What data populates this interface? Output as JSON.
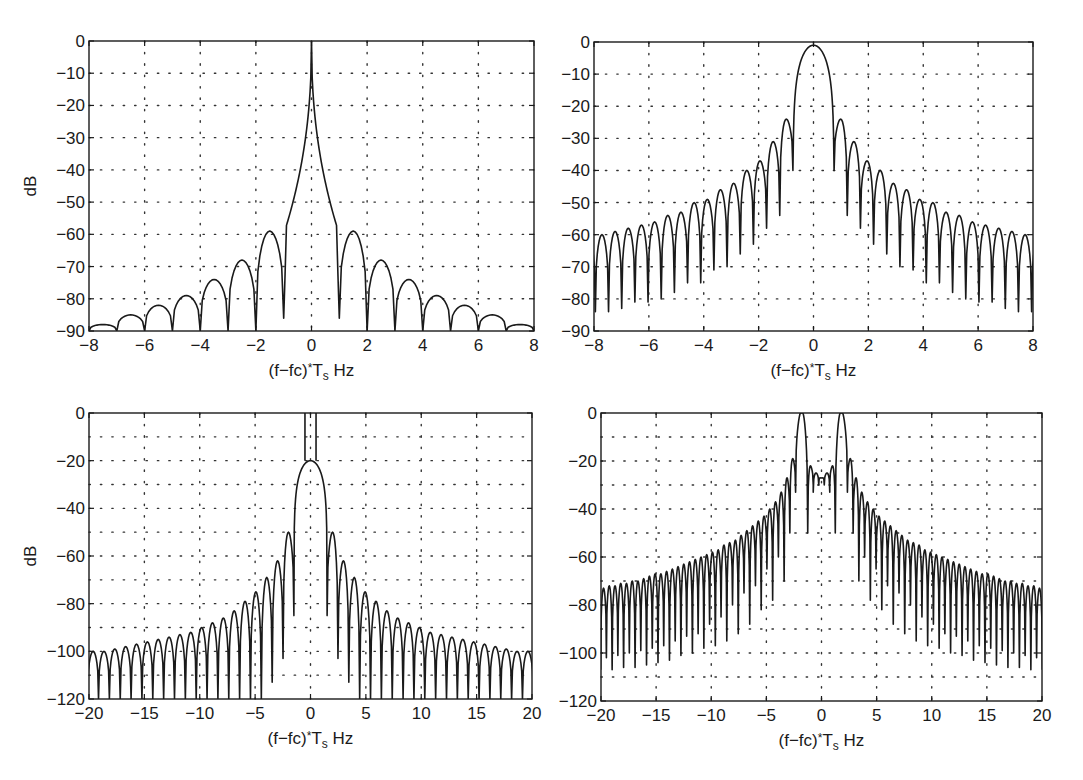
{
  "figure": {
    "xlabel_parts": {
      "pre": "(f−fc)",
      "sup": "*",
      "mid": "T",
      "sub": "s",
      "post": " Hz"
    },
    "ylabel": "dB",
    "line_color": "#1a1a1a",
    "grid_color": "#333333"
  },
  "chart_data": [
    {
      "id": "top-left",
      "type": "line",
      "title": "",
      "xlabel": "(f-fc)*Ts Hz",
      "ylabel": "dB",
      "xlim": [
        -8,
        8
      ],
      "ylim": [
        -90,
        0
      ],
      "xticks": [
        -8,
        -6,
        -4,
        -2,
        0,
        2,
        4,
        6,
        8
      ],
      "yticks": [
        0,
        -10,
        -20,
        -30,
        -40,
        -50,
        -60,
        -70,
        -80,
        -90
      ],
      "ytick_labels": [
        "0",
        "−10",
        "−20",
        "−30",
        "−40",
        "−50",
        "−60",
        "−70",
        "−80",
        "−90"
      ],
      "xtick_labels": [
        "−8",
        "−6",
        "−4",
        "−2",
        "0",
        "2",
        "4",
        "6",
        "8"
      ],
      "grid": true,
      "grid_y_step": 10,
      "grid_x_step": 2,
      "box": {
        "left": 89,
        "top": 41,
        "right": 534,
        "bottom": 331
      },
      "main_lobe": {
        "peak": 0,
        "null_at": 1.0,
        "null_depth": -86,
        "shape": "sharp"
      },
      "lobe_spacing": 1.0,
      "first_lobe_start": 1.0,
      "sidelobe_peaks": [
        -59,
        -68,
        -74,
        -79,
        -82,
        -85,
        -88
      ],
      "null_depths": [
        -86,
        -90,
        -90,
        -90,
        -90,
        -90,
        -90,
        -90
      ],
      "series": [
        {
          "name": "spectrum",
          "description": "Sharp spike to 0 dB at 0, sidelobes peaking at -59 (±1.4), -68 (±2.5), -74 (±3.5), -79 (±4.5), -82 (±5.5), -85 (±6.5), -88 (±7.5), nulls at integer offsets"
        }
      ]
    },
    {
      "id": "top-right",
      "type": "line",
      "title": "",
      "xlabel": "(f-fc)*Ts Hz",
      "ylabel": "",
      "xlim": [
        -8,
        8
      ],
      "ylim": [
        -90,
        0
      ],
      "xticks": [
        -8,
        -6,
        -4,
        -2,
        0,
        2,
        4,
        6,
        8
      ],
      "yticks": [
        0,
        -10,
        -20,
        -30,
        -40,
        -50,
        -60,
        -70,
        -80,
        -90
      ],
      "ytick_labels": [
        "0",
        "−10",
        "−20",
        "−30",
        "−40",
        "−50",
        "−60",
        "−70",
        "−80",
        "−90"
      ],
      "xtick_labels": [
        "−8",
        "−6",
        "−4",
        "−2",
        "0",
        "2",
        "4",
        "6",
        "8"
      ],
      "grid": true,
      "grid_y_step": 10,
      "grid_x_step": 2,
      "box": {
        "left": 594,
        "top": 42,
        "right": 1033,
        "bottom": 331
      },
      "main_lobe": {
        "peak": -1,
        "null_at": 0.75,
        "null_depth": -40,
        "shape": "round"
      },
      "lobe_spacing": 0.48,
      "first_lobe_start": 0.75,
      "sidelobe_peaks": [
        -24,
        -31,
        -37,
        -40,
        -44,
        -46,
        -49,
        -50,
        -53,
        -54,
        -56,
        -57,
        -58,
        -59,
        -60,
        -61
      ],
      "null_depths": [
        -40,
        -54,
        -58,
        -63,
        -66,
        -70,
        -71,
        -75,
        -75,
        -78,
        -80,
        -81,
        -81,
        -83,
        -84,
        -84,
        -80
      ],
      "series": [
        {
          "name": "spectrum",
          "description": "Rounded main lobe peak ≈0 dB, nulls at ±0.75 (-40 dB), sidelobes spaced ~0.5 Hz decaying from -24 to about -60 at ±8"
        }
      ]
    },
    {
      "id": "bottom-left",
      "type": "line",
      "title": "",
      "xlabel": "(f-fc)*Ts Hz",
      "ylabel": "dB",
      "xlim": [
        -20,
        20
      ],
      "ylim": [
        -120,
        0
      ],
      "xticks": [
        -20,
        -15,
        -10,
        -5,
        0,
        5,
        10,
        15,
        20
      ],
      "yticks": [
        0,
        -20,
        -40,
        -60,
        -80,
        -100,
        -120
      ],
      "ytick_labels": [
        "0",
        "−20",
        "−40",
        "−60",
        "−80",
        "−100",
        "−120"
      ],
      "xtick_labels": [
        "−20",
        "−15",
        "−10",
        "−5",
        "0",
        "5",
        "10",
        "15",
        "20"
      ],
      "grid": true,
      "grid_y_step": 10,
      "grid_x_step": 5,
      "box": {
        "left": 89,
        "top": 413,
        "right": 532,
        "bottom": 699
      },
      "main_lobe": {
        "peak": -20,
        "null_at": 1.5,
        "null_depth": -85,
        "shape": "round"
      },
      "carrier_lines": {
        "x": [
          -0.5,
          0.5
        ],
        "from": -20,
        "to": 0
      },
      "lobe_spacing": 0.98,
      "first_lobe_start": 1.5,
      "sidelobe_peaks": [
        -50,
        -62,
        -69,
        -75,
        -79,
        -83,
        -86,
        -88,
        -90,
        -92,
        -93,
        -94,
        -95,
        -96,
        -97,
        -98,
        -99,
        -100,
        -100,
        -101
      ],
      "null_depths": [
        -85,
        -103,
        -113,
        -120,
        -120,
        -120,
        -120,
        -120,
        -120,
        -120,
        -120,
        -120,
        -120,
        -120,
        -120,
        -120,
        -120,
        -120,
        -120,
        -120,
        -120
      ],
      "series": [
        {
          "name": "spectrum",
          "description": "Main lobe peaking at about -20 dB with two carrier lines reaching 0 dB near ±0.5; sidelobes ~1 Hz apart decaying from -50 to about -102 at ±20"
        }
      ]
    },
    {
      "id": "bottom-right",
      "type": "line",
      "title": "",
      "xlabel": "(f-fc)*Ts Hz",
      "ylabel": "",
      "xlim": [
        -20,
        20
      ],
      "ylim": [
        -120,
        0
      ],
      "xticks": [
        -20,
        -15,
        -10,
        -5,
        0,
        5,
        10,
        15,
        20
      ],
      "yticks": [
        0,
        -20,
        -40,
        -60,
        -80,
        -100,
        -120
      ],
      "ytick_labels": [
        "0",
        "−20",
        "−40",
        "−60",
        "−80",
        "−100",
        "−120"
      ],
      "xtick_labels": [
        "−20",
        "−15",
        "−10",
        "−5",
        "0",
        "5",
        "10",
        "15",
        "20"
      ],
      "grid": true,
      "grid_y_step": 10,
      "grid_x_step": 5,
      "box": {
        "left": 601,
        "top": 413,
        "right": 1042,
        "bottom": 701
      },
      "twin_peaks": {
        "x": [
          -1.8,
          1.8
        ],
        "peak": 0,
        "null_half_width": 0.55,
        "null_depth": -33
      },
      "center_lobes": [
        -22,
        -25,
        -27,
        -25,
        -22
      ],
      "lobe_spacing": 0.52,
      "first_lobe_start": 2.35,
      "sidelobe_peaks": [
        -19,
        -27,
        -33,
        -37,
        -40,
        -43,
        -45,
        -47,
        -49,
        -51,
        -53,
        -54,
        -55,
        -57,
        -58,
        -59,
        -60,
        -61,
        -62,
        -63,
        -64,
        -65,
        -66,
        -67,
        -67,
        -68,
        -69,
        -70,
        -70,
        -71,
        -71,
        -72,
        -72,
        -73,
        -73,
        -74
      ],
      "null_depths": [
        -33,
        -50,
        -70,
        -60,
        -78,
        -65,
        -82,
        -72,
        -88,
        -75,
        -92,
        -80,
        -95,
        -85,
        -97,
        -88,
        -98,
        -92,
        -100,
        -93,
        -101,
        -95,
        -103,
        -97,
        -104,
        -98,
        -105,
        -99,
        -106,
        -100,
        -106,
        -101,
        -107,
        -102,
        -107,
        -103,
        -108
      ],
      "series": [
        {
          "name": "spectrum",
          "description": "Two peaks reaching 0 dB at about ±1.8 Hz, central region around -20 to -30 dB, dense sidelobes (~0.5 Hz spacing) decaying to about -74 dB at ±20 with nulls near -100 dB"
        }
      ]
    }
  ]
}
